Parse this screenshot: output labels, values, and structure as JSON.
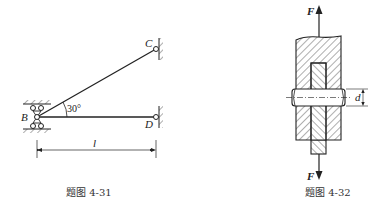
{
  "figure_4_31": {
    "caption": "题图 4-31",
    "labels": {
      "B": "B",
      "C": "C",
      "D": "D",
      "length": "l",
      "angle": "30°"
    }
  },
  "figure_4_32": {
    "caption": "题图 4-32",
    "labels": {
      "force_top": "F",
      "force_bottom": "F",
      "diameter": "d"
    }
  }
}
